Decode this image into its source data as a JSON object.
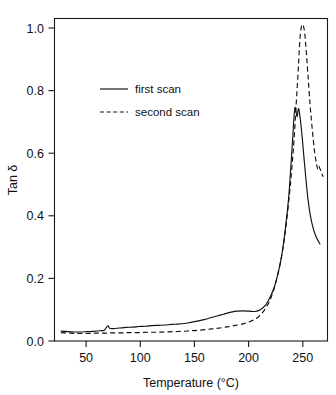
{
  "chart_data": {
    "type": "line",
    "title": "",
    "xlabel": "Temperature (°C)",
    "ylabel": "Tan δ",
    "xlim": [
      20,
      272
    ],
    "ylim": [
      0.0,
      1.07
    ],
    "xticks": [
      50,
      100,
      150,
      200,
      250
    ],
    "yticks": [
      "0.0",
      "0.2",
      "0.4",
      "0.6",
      "0.8",
      "1.0"
    ],
    "grid": false,
    "legend_position": "upper-left-inside",
    "series": [
      {
        "name": "first scan",
        "style": "solid",
        "color": "#111111",
        "points": [
          [
            26,
            0.033
          ],
          [
            32,
            0.031
          ],
          [
            38,
            0.03
          ],
          [
            44,
            0.03
          ],
          [
            50,
            0.031
          ],
          [
            56,
            0.032
          ],
          [
            62,
            0.034
          ],
          [
            66,
            0.036
          ],
          [
            69,
            0.05
          ],
          [
            71,
            0.042
          ],
          [
            74,
            0.041
          ],
          [
            80,
            0.043
          ],
          [
            86,
            0.045
          ],
          [
            92,
            0.046
          ],
          [
            98,
            0.048
          ],
          [
            104,
            0.049
          ],
          [
            110,
            0.051
          ],
          [
            116,
            0.052
          ],
          [
            122,
            0.053
          ],
          [
            128,
            0.055
          ],
          [
            134,
            0.056
          ],
          [
            140,
            0.058
          ],
          [
            146,
            0.062
          ],
          [
            152,
            0.066
          ],
          [
            158,
            0.071
          ],
          [
            164,
            0.077
          ],
          [
            170,
            0.083
          ],
          [
            176,
            0.089
          ],
          [
            182,
            0.095
          ],
          [
            188,
            0.099
          ],
          [
            194,
            0.1
          ],
          [
            200,
            0.099
          ],
          [
            205,
            0.098
          ],
          [
            210,
            0.104
          ],
          [
            215,
            0.12
          ],
          [
            219,
            0.145
          ],
          [
            223,
            0.18
          ],
          [
            227,
            0.235
          ],
          [
            230,
            0.29
          ],
          [
            233,
            0.37
          ],
          [
            236,
            0.47
          ],
          [
            238,
            0.57
          ],
          [
            240,
            0.68
          ],
          [
            241,
            0.74
          ],
          [
            242,
            0.775
          ],
          [
            243,
            0.76
          ],
          [
            244,
            0.745
          ],
          [
            245,
            0.77
          ],
          [
            246,
            0.76
          ],
          [
            248,
            0.7
          ],
          [
            250,
            0.62
          ],
          [
            252,
            0.54
          ],
          [
            254,
            0.47
          ],
          [
            256,
            0.42
          ],
          [
            258,
            0.385
          ],
          [
            260,
            0.36
          ],
          [
            262,
            0.342
          ],
          [
            265,
            0.322
          ]
        ]
      },
      {
        "name": "second scan",
        "style": "dashed",
        "color": "#111111",
        "points": [
          [
            26,
            0.028
          ],
          [
            34,
            0.026
          ],
          [
            42,
            0.025
          ],
          [
            50,
            0.025
          ],
          [
            58,
            0.026
          ],
          [
            66,
            0.026
          ],
          [
            74,
            0.027
          ],
          [
            82,
            0.027
          ],
          [
            90,
            0.028
          ],
          [
            98,
            0.028
          ],
          [
            106,
            0.029
          ],
          [
            114,
            0.029
          ],
          [
            122,
            0.03
          ],
          [
            130,
            0.031
          ],
          [
            138,
            0.032
          ],
          [
            146,
            0.034
          ],
          [
            154,
            0.036
          ],
          [
            162,
            0.039
          ],
          [
            170,
            0.042
          ],
          [
            178,
            0.046
          ],
          [
            186,
            0.051
          ],
          [
            194,
            0.057
          ],
          [
            200,
            0.064
          ],
          [
            206,
            0.074
          ],
          [
            211,
            0.09
          ],
          [
            216,
            0.115
          ],
          [
            220,
            0.145
          ],
          [
            224,
            0.19
          ],
          [
            228,
            0.25
          ],
          [
            231,
            0.31
          ],
          [
            234,
            0.39
          ],
          [
            237,
            0.49
          ],
          [
            239,
            0.57
          ],
          [
            241,
            0.66
          ],
          [
            243,
            0.78
          ],
          [
            245,
            0.9
          ],
          [
            246,
            0.97
          ],
          [
            247,
            1.02
          ],
          [
            248,
            1.045
          ],
          [
            249,
            1.05
          ],
          [
            250,
            1.042
          ],
          [
            251,
            1.02
          ],
          [
            252,
            0.98
          ],
          [
            254,
            0.88
          ],
          [
            256,
            0.78
          ],
          [
            258,
            0.7
          ],
          [
            260,
            0.63
          ],
          [
            262,
            0.585
          ],
          [
            263,
            0.57
          ],
          [
            264,
            0.58
          ],
          [
            266,
            0.562
          ],
          [
            268,
            0.545
          ]
        ]
      }
    ]
  },
  "axes": {
    "y_title": "Tan δ",
    "x_title": "Temperature (°C)",
    "x_tick_labels": [
      "50",
      "100",
      "150",
      "200",
      "250"
    ],
    "y_tick_labels": [
      "0.0",
      "0.2",
      "0.4",
      "0.6",
      "0.8",
      "1.0"
    ]
  },
  "legend": {
    "entries": [
      {
        "label": "first scan",
        "style": "solid"
      },
      {
        "label": "second scan",
        "style": "dashed"
      }
    ]
  }
}
